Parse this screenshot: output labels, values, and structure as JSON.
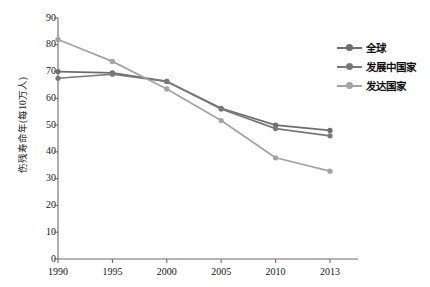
{
  "chart_data": {
    "type": "line",
    "title": "",
    "xlabel": "",
    "ylabel": "伤残寿命年(每10万人)",
    "categories": [
      "1990",
      "1995",
      "2000",
      "2005",
      "2010",
      "2013"
    ],
    "x": [
      1990,
      1995,
      2000,
      2005,
      2010,
      2013
    ],
    "ylim": [
      0,
      90
    ],
    "yticks": [
      "0",
      "10",
      "20",
      "30",
      "40",
      "50",
      "60",
      "70",
      "80",
      "90"
    ],
    "ytick_values": [
      0,
      10,
      20,
      30,
      40,
      50,
      60,
      70,
      80,
      90
    ],
    "grid": false,
    "legend_position": "right",
    "series": [
      {
        "name": "全球",
        "color": "#6e6e6e",
        "marker": "circle",
        "values": [
          70.0,
          69.5,
          66.3,
          56.3,
          50.0,
          48.0
        ]
      },
      {
        "name": "发展中国家",
        "color": "#787878",
        "marker": "circle",
        "values": [
          67.5,
          69.0,
          66.3,
          56.0,
          48.7,
          46.0
        ]
      },
      {
        "name": "发达国家",
        "color": "#a3a3a3",
        "marker": "circle",
        "values": [
          82.0,
          73.8,
          63.5,
          51.7,
          37.8,
          32.8
        ]
      }
    ]
  },
  "axes": {
    "axis_color": "#6b6b6b",
    "tick_color": "#6b6b6b",
    "text_color": "#141414"
  },
  "plot_geometry": {
    "left": 58,
    "right": 330,
    "top": 18,
    "bottom": 259
  }
}
